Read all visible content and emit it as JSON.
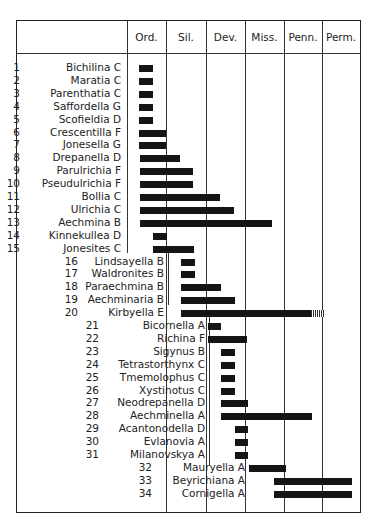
{
  "chart_data": {
    "type": "range-bar",
    "title": "",
    "columns": [
      "Ord.",
      "Sil.",
      "Dev.",
      "Miss.",
      "Penn.",
      "Perm."
    ],
    "column_x": [
      127,
      166,
      206,
      245,
      284,
      322,
      360
    ],
    "rows": [
      {
        "n": "1",
        "name": "Bichilina",
        "code": "C",
        "start": 139,
        "end": 153,
        "indent": 0
      },
      {
        "n": "2",
        "name": "Maratia",
        "code": "C",
        "start": 139,
        "end": 153,
        "indent": 0
      },
      {
        "n": "3",
        "name": "Parenthatia",
        "code": "C",
        "start": 139,
        "end": 153,
        "indent": 0
      },
      {
        "n": "4",
        "name": "Saffordella",
        "code": "G",
        "start": 139,
        "end": 153,
        "indent": 0
      },
      {
        "n": "5",
        "name": "Scofieldia",
        "code": "D",
        "start": 139,
        "end": 153,
        "indent": 0
      },
      {
        "n": "6",
        "name": "Crescentilla",
        "code": "F",
        "start": 139,
        "end": 166,
        "indent": 0
      },
      {
        "n": "7",
        "name": "Jonesella",
        "code": "G",
        "start": 139,
        "end": 166,
        "indent": 0
      },
      {
        "n": "8",
        "name": "Drepanella",
        "code": "D",
        "start": 140,
        "end": 180,
        "indent": 0
      },
      {
        "n": "9",
        "name": "Parulrichia",
        "code": "F",
        "start": 140,
        "end": 193,
        "indent": 0
      },
      {
        "n": "10",
        "name": "Pseudulrichia",
        "code": "F",
        "start": 140,
        "end": 193,
        "indent": 0
      },
      {
        "n": "11",
        "name": "Bollia",
        "code": "C",
        "start": 140,
        "end": 220,
        "indent": 0
      },
      {
        "n": "12",
        "name": "Ulrichia",
        "code": "C",
        "start": 140,
        "end": 234,
        "indent": 0
      },
      {
        "n": "13",
        "name": "Aechmina",
        "code": "B",
        "start": 140,
        "end": 272,
        "indent": 0
      },
      {
        "n": "14",
        "name": "Kinnekullea",
        "code": "D",
        "start": 153,
        "end": 167,
        "indent": 0
      },
      {
        "n": "15",
        "name": "Jonesites",
        "code": "C",
        "start": 153,
        "end": 194,
        "indent": 0
      },
      {
        "n": "16",
        "name": "Lindsayella",
        "code": "B",
        "start": 181,
        "end": 195,
        "indent": 1
      },
      {
        "n": "17",
        "name": "Waldronites",
        "code": "B",
        "start": 181,
        "end": 195,
        "indent": 1
      },
      {
        "n": "18",
        "name": "Paraechmina",
        "code": "B",
        "start": 181,
        "end": 221,
        "indent": 1
      },
      {
        "n": "19",
        "name": "Aechminaria",
        "code": "B",
        "start": 181,
        "end": 235,
        "indent": 1
      },
      {
        "n": "20",
        "name": "Kirbyella",
        "code": "E",
        "start": 181,
        "end": 311,
        "hatch_end": 324,
        "indent": 1
      },
      {
        "n": "21",
        "name": "Bicornella",
        "code": "A",
        "start": 208,
        "end": 221,
        "indent": 2
      },
      {
        "n": "22",
        "name": "Richina",
        "code": "F",
        "start": 208,
        "end": 247,
        "indent": 2
      },
      {
        "n": "23",
        "name": "Sigynus",
        "code": "B",
        "start": 221,
        "end": 235,
        "indent": 2
      },
      {
        "n": "24",
        "name": "Tetrastorthynx",
        "code": "C",
        "start": 221,
        "end": 235,
        "indent": 2
      },
      {
        "n": "25",
        "name": "Tmemolophus",
        "code": "C",
        "start": 221,
        "end": 235,
        "indent": 2
      },
      {
        "n": "26",
        "name": "Xystinotus",
        "code": "C",
        "start": 221,
        "end": 235,
        "indent": 2
      },
      {
        "n": "27",
        "name": "Neodrepanella",
        "code": "D",
        "start": 221,
        "end": 248,
        "indent": 2
      },
      {
        "n": "28",
        "name": "Aechminella",
        "code": "A",
        "start": 221,
        "end": 312,
        "indent": 2
      },
      {
        "n": "29",
        "name": "Acantonodella",
        "code": "D",
        "start": 235,
        "end": 248,
        "indent": 2
      },
      {
        "n": "30",
        "name": "Evlanovia",
        "code": "A",
        "start": 235,
        "end": 248,
        "indent": 2
      },
      {
        "n": "31",
        "name": "Milanovskya",
        "code": "A",
        "start": 235,
        "end": 248,
        "indent": 2
      },
      {
        "n": "32",
        "name": "Mauryella",
        "code": "A",
        "start": 249,
        "end": 286,
        "indent": 3
      },
      {
        "n": "33",
        "name": "Beyrichiana",
        "code": "A",
        "start": 274,
        "end": 352,
        "indent": 3
      },
      {
        "n": "34",
        "name": "Cornigella",
        "code": "A",
        "start": 274,
        "end": 352,
        "indent": 3
      }
    ],
    "xlabel": "Geologic period",
    "ylabel": "Genus (family code)",
    "grid": true,
    "legend": null
  }
}
